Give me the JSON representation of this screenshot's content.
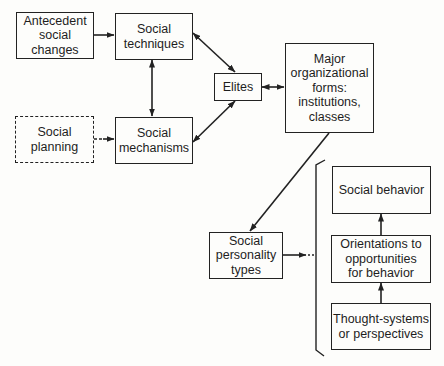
{
  "diagram": {
    "nodes": {
      "antecedent": "Antecedent\nsocial\nchanges",
      "techniques": "Social\ntechniques",
      "planning": "Social\nplanning",
      "mechanisms": "Social\nmechanisms",
      "elites": "Elites",
      "major": "Major\norganizational\nforms:\ninstitutions,\nclasses",
      "personality": "Social\npersonality\ntypes",
      "behavior": "Social behavior",
      "orientations": "Orientations to\nopportunities\nfor behavior",
      "thought": "Thought-systems\nor perspectives"
    },
    "edges": [
      {
        "from": "antecedent",
        "to": "techniques",
        "type": "arrow"
      },
      {
        "from": "planning",
        "to": "mechanisms",
        "type": "dashed-arrow"
      },
      {
        "from": "techniques",
        "to": "mechanisms",
        "type": "double-arrow"
      },
      {
        "from": "techniques",
        "to": "elites",
        "type": "double-arrow"
      },
      {
        "from": "mechanisms",
        "to": "elites",
        "type": "double-arrow"
      },
      {
        "from": "elites",
        "to": "major",
        "type": "double-arrow"
      },
      {
        "from": "major",
        "to": "personality",
        "type": "arrow"
      },
      {
        "from": "personality",
        "to": "bracket-group",
        "type": "arrow"
      },
      {
        "from": "thought",
        "to": "orientations",
        "type": "arrow"
      },
      {
        "from": "orientations",
        "to": "behavior",
        "type": "arrow"
      }
    ],
    "colors": {
      "line": "#222222",
      "background": "#fdfdfb"
    }
  }
}
